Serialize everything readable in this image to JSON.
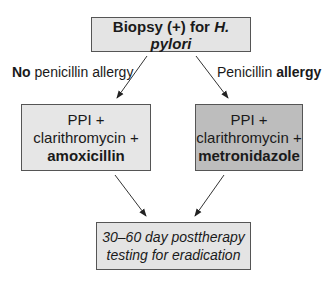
{
  "diagram": {
    "top_node": {
      "text_plain": "Biopsy (+) for ",
      "text_italic": "H. pylori"
    },
    "branches": {
      "left": {
        "label_bold": "No",
        "label_rest": " penicillin allergy"
      },
      "right": {
        "label_rest": "Penicillin ",
        "label_bold": "allergy"
      }
    },
    "left_node": {
      "line1": "PPI +",
      "line2": "clarithromycin +",
      "line3_bold": "amoxicillin"
    },
    "right_node": {
      "line1": "PPI +",
      "line2": "clarithromycin +",
      "line3_bold": "metronidazole"
    },
    "bottom_node": {
      "line1": "30–60 day posttherapy",
      "line2": "testing for eradication"
    },
    "colors": {
      "light_box": "#e4e4e4",
      "dark_box": "#bdbdbd",
      "border": "#555555"
    }
  }
}
